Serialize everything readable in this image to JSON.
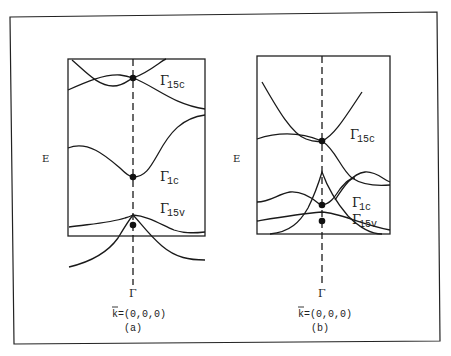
{
  "figure": {
    "panels": [
      {
        "id": "a",
        "caption": "(a)",
        "k_label": "k=(0,0,0)",
        "k_bar": "k",
        "axis_label": "E",
        "gamma_tick": "Γ",
        "states": [
          {
            "symbol": "Γ",
            "subscript": "15c"
          },
          {
            "symbol": "Γ",
            "subscript": "1c"
          },
          {
            "symbol": "Γ",
            "subscript": "15v"
          }
        ]
      },
      {
        "id": "b",
        "caption": "(b)",
        "k_label": "k=(0,0,0)",
        "k_bar": "k",
        "axis_label": "E",
        "gamma_tick": "Γ",
        "states": [
          {
            "symbol": "Γ",
            "subscript": "15c"
          },
          {
            "symbol": "Γ",
            "subscript": "1c"
          },
          {
            "symbol": "Γ",
            "subscript": "15v"
          }
        ]
      }
    ]
  }
}
